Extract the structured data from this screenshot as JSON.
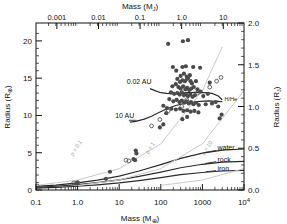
{
  "chart_data": {
    "type": "scatter",
    "title": "",
    "xlabel": "Mass (M⊕)",
    "ylabel": "Radius (R⊕)",
    "xlabel_top": "Mass (Mⱼ)",
    "ylabel_right": "Radius (Rⱼ)",
    "xscale": "log",
    "yscale": "linear",
    "xlim": [
      0.1,
      10000
    ],
    "ylim": [
      0,
      22.4
    ],
    "ylim_right": [
      0.0,
      2.0
    ],
    "xlim_top": [
      0.000314,
      31.4
    ],
    "grid": false,
    "legend_position": "none",
    "xticks_bottom": [
      "0.1",
      "1.0",
      "10",
      "100",
      "1000",
      "10⁴"
    ],
    "xtick_values_bottom": [
      0.1,
      1,
      10,
      100,
      1000,
      10000
    ],
    "yticks_left": [
      "0",
      "5",
      "10",
      "15",
      "20"
    ],
    "ytick_values_left": [
      0,
      5,
      10,
      15,
      20
    ],
    "xticks_top": [
      "0.001",
      "0.01",
      "0.1",
      "1.0",
      "10"
    ],
    "xtick_values_top": [
      0.001,
      0.01,
      0.1,
      1.0,
      10
    ],
    "yticks_right": [
      "0.0",
      "0.5",
      "1.0",
      "1.5",
      "2.0"
    ],
    "ytick_values_right": [
      0.0,
      0.5,
      1.0,
      1.5,
      2.0
    ],
    "annotations": [
      {
        "text": "0.02 AU",
        "x": 60,
        "y": 14.2,
        "name": "curve-label-002au"
      },
      {
        "text": "10 AU",
        "x": 23,
        "y": 9.6,
        "name": "curve-label-10au"
      },
      {
        "text": "H/He",
        "x": 3400,
        "y": 11.9,
        "name": "curve-label-hhe"
      },
      {
        "text": "water",
        "x": 2300,
        "y": 5.3,
        "name": "curve-label-water"
      },
      {
        "text": "rock",
        "x": 2300,
        "y": 3.8,
        "name": "curve-label-rock"
      },
      {
        "text": "iron",
        "x": 2300,
        "y": 2.6,
        "name": "curve-label-iron"
      },
      {
        "text": "ρ = 0.1",
        "x": 1.0,
        "y": 5.5,
        "name": "density-label-0p1"
      },
      {
        "text": "ρ = 1",
        "x": 60,
        "y": 5.5,
        "name": "density-label-1"
      },
      {
        "text": "ρ = 10",
        "x": 1400,
        "y": 5.5,
        "name": "density-label-10"
      }
    ],
    "series": [
      {
        "name": "0.02 AU",
        "type": "line",
        "color": "#2b2b2b",
        "points": [
          [
            55,
            13.6
          ],
          [
            75,
            13.3
          ],
          [
            100,
            13.05
          ],
          [
            140,
            12.95
          ],
          [
            200,
            12.9
          ],
          [
            300,
            12.95
          ],
          [
            450,
            13.05
          ],
          [
            700,
            13.1
          ],
          [
            1100,
            13.05
          ],
          [
            1700,
            12.95
          ],
          [
            2400,
            12.6
          ],
          [
            3000,
            12.1
          ]
        ]
      },
      {
        "name": "10 AU",
        "type": "line",
        "color": "#2b2b2b",
        "points": [
          [
            18,
            9.1
          ],
          [
            25,
            9.2
          ],
          [
            40,
            9.5
          ],
          [
            60,
            9.9
          ],
          [
            90,
            10.4
          ],
          [
            140,
            10.9
          ],
          [
            220,
            11.3
          ],
          [
            350,
            11.6
          ],
          [
            550,
            11.8
          ],
          [
            900,
            11.9
          ],
          [
            1400,
            11.95
          ],
          [
            2200,
            11.9
          ],
          [
            3000,
            11.85
          ]
        ]
      },
      {
        "name": "water",
        "type": "line",
        "color": "#2b2b2b",
        "points": [
          [
            0.1,
            0.48
          ],
          [
            0.3,
            0.66
          ],
          [
            1,
            0.95
          ],
          [
            3,
            1.32
          ],
          [
            10,
            1.86
          ],
          [
            30,
            2.55
          ],
          [
            100,
            3.4
          ],
          [
            300,
            4.25
          ],
          [
            1000,
            4.95
          ],
          [
            3000,
            5.35
          ],
          [
            10000,
            5.5
          ]
        ]
      },
      {
        "name": "rock",
        "type": "line",
        "color": "#2b2b2b",
        "points": [
          [
            0.1,
            0.36
          ],
          [
            0.3,
            0.5
          ],
          [
            1,
            0.71
          ],
          [
            3,
            0.98
          ],
          [
            10,
            1.36
          ],
          [
            30,
            1.82
          ],
          [
            100,
            2.4
          ],
          [
            300,
            2.98
          ],
          [
            1000,
            3.45
          ],
          [
            3000,
            3.75
          ],
          [
            10000,
            3.85
          ]
        ]
      },
      {
        "name": "iron",
        "type": "line",
        "color": "#2b2b2b",
        "points": [
          [
            0.1,
            0.26
          ],
          [
            0.3,
            0.36
          ],
          [
            1,
            0.5
          ],
          [
            3,
            0.69
          ],
          [
            10,
            0.95
          ],
          [
            30,
            1.27
          ],
          [
            100,
            1.66
          ],
          [
            300,
            2.05
          ],
          [
            1000,
            2.35
          ],
          [
            3000,
            2.55
          ],
          [
            10000,
            2.62
          ]
        ]
      },
      {
        "name": "ρ = 0.1",
        "type": "line",
        "color": "#c9c9c9",
        "points": [
          [
            0.1,
            0.62
          ],
          [
            1,
            1.33
          ],
          [
            10,
            2.87
          ],
          [
            100,
            6.19
          ],
          [
            1000,
            13.33
          ],
          [
            3000,
            19.2
          ]
        ]
      },
      {
        "name": "ρ = 1",
        "type": "line",
        "color": "#c9c9c9",
        "points": [
          [
            1,
            0.62
          ],
          [
            10,
            1.33
          ],
          [
            100,
            2.87
          ],
          [
            1000,
            6.19
          ],
          [
            10000,
            13.33
          ]
        ]
      },
      {
        "name": "ρ = 10",
        "type": "line",
        "color": "#c9c9c9",
        "points": [
          [
            100,
            0.62
          ],
          [
            1000,
            1.33
          ],
          [
            10000,
            2.87
          ]
        ]
      }
    ],
    "scatter_filled": {
      "name": "transiting planets",
      "marker": "filled-circle",
      "color": "#4a4a4a",
      "points": [
        [
          150,
          19.6
        ],
        [
          340,
          19.95
        ],
        [
          450,
          20.1
        ],
        [
          195,
          16.5
        ],
        [
          235,
          16.0
        ],
        [
          330,
          16.5
        ],
        [
          400,
          16.6
        ],
        [
          600,
          16.5
        ],
        [
          880,
          16.4
        ],
        [
          300,
          15.3
        ],
        [
          360,
          15.6
        ],
        [
          420,
          15.2
        ],
        [
          455,
          15.1
        ],
        [
          500,
          15.4
        ],
        [
          250,
          14.9
        ],
        [
          290,
          14.5
        ],
        [
          330,
          14.7
        ],
        [
          380,
          14.6
        ],
        [
          430,
          14.9
        ],
        [
          520,
          14.6
        ],
        [
          560,
          14.3
        ],
        [
          700,
          14.6
        ],
        [
          1500,
          14.4
        ],
        [
          190,
          13.9
        ],
        [
          230,
          14.2
        ],
        [
          265,
          13.8
        ],
        [
          300,
          13.6
        ],
        [
          345,
          13.9
        ],
        [
          390,
          13.5
        ],
        [
          430,
          13.7
        ],
        [
          480,
          13.4
        ],
        [
          540,
          13.6
        ],
        [
          620,
          13.8
        ],
        [
          760,
          13.5
        ],
        [
          900,
          13.2
        ],
        [
          175,
          13.1
        ],
        [
          210,
          12.9
        ],
        [
          250,
          13.0
        ],
        [
          285,
          12.8
        ],
        [
          320,
          13.1
        ],
        [
          360,
          12.7
        ],
        [
          400,
          12.9
        ],
        [
          450,
          12.6
        ],
        [
          510,
          12.8
        ],
        [
          580,
          12.5
        ],
        [
          660,
          12.7
        ],
        [
          1050,
          12.6
        ],
        [
          1350,
          12.9
        ],
        [
          160,
          12.2
        ],
        [
          200,
          11.9
        ],
        [
          240,
          12.1
        ],
        [
          280,
          11.8
        ],
        [
          320,
          12.0
        ],
        [
          365,
          11.7
        ],
        [
          410,
          11.9
        ],
        [
          470,
          11.6
        ],
        [
          530,
          11.8
        ],
        [
          610,
          11.5
        ],
        [
          700,
          11.7
        ],
        [
          820,
          11.4
        ],
        [
          1200,
          11.5
        ],
        [
          1700,
          11.6
        ],
        [
          2100,
          11.8
        ],
        [
          2400,
          11.2
        ],
        [
          140,
          11.0
        ],
        [
          180,
          10.9
        ],
        [
          230,
          10.8
        ],
        [
          290,
          10.9
        ],
        [
          350,
          10.6
        ],
        [
          430,
          10.7
        ],
        [
          520,
          10.5
        ],
        [
          640,
          10.6
        ],
        [
          800,
          10.4
        ],
        [
          2600,
          9.6
        ],
        [
          2900,
          10.1
        ],
        [
          115,
          11.3
        ],
        [
          135,
          10.3
        ],
        [
          95,
          8.4
        ],
        [
          115,
          8.8
        ],
        [
          330,
          9.5
        ],
        [
          430,
          9.8
        ],
        [
          25,
          5.3
        ],
        [
          26,
          4.9
        ],
        [
          22,
          4.15
        ],
        [
          24,
          4.0
        ],
        [
          6,
          2.45
        ],
        [
          4.8,
          1.5
        ],
        [
          1.0,
          0.95
        ],
        [
          0.95,
          0.88
        ]
      ]
    },
    "scatter_open": {
      "name": "solar system planets",
      "marker": "open-circle",
      "color": "#555555",
      "points": [
        [
          318,
          11.2
        ],
        [
          95,
          9.45
        ],
        [
          14.5,
          4.0
        ],
        [
          17.1,
          3.9
        ],
        [
          1.0,
          1.0
        ],
        [
          0.81,
          0.95
        ],
        [
          0.107,
          0.53
        ],
        [
          0.055,
          0.38
        ],
        [
          60,
          8.6
        ],
        [
          150,
          10.6
        ],
        [
          420,
          12.1
        ],
        [
          760,
          13.0
        ],
        [
          1500,
          13.8
        ],
        [
          2200,
          14.6
        ],
        [
          2800,
          15.1
        ]
      ]
    }
  }
}
